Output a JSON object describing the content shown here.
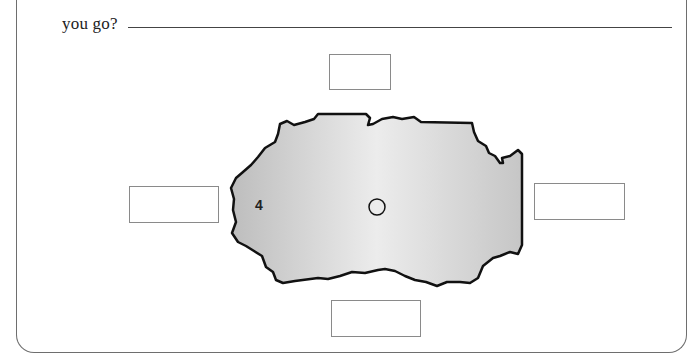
{
  "worksheet": {
    "question_fragment": "you go?",
    "answer_value": "",
    "direction_boxes": {
      "north": {
        "value": ""
      },
      "west": {
        "value": ""
      },
      "east": {
        "value": ""
      },
      "south": {
        "value": ""
      }
    },
    "map": {
      "region_label": "4",
      "marker": "circle",
      "fill_color": "#d4d4d4",
      "outline_color": "#111111"
    }
  }
}
